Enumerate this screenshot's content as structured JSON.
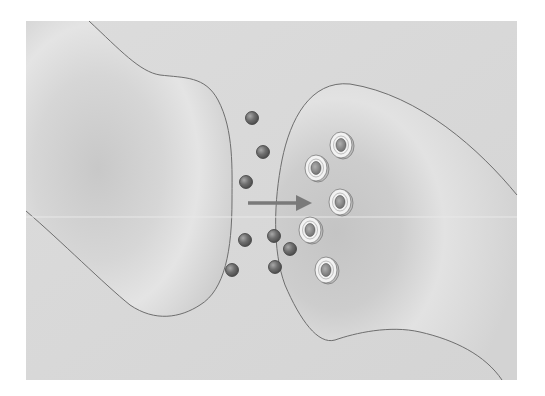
{
  "diagram": {
    "type": "synapse",
    "panel": {
      "x": 26,
      "y": 21,
      "width": 491,
      "height": 359,
      "fill": "#d9d9d9"
    },
    "colors": {
      "background": "#ffffff",
      "panel": "#d9d9d9",
      "neuron_fill": "#cfcfcf",
      "outline": "#6e6e6e",
      "arrow": "#7a7a7a",
      "neurotransmitter": "#6a6a6a",
      "receptor_ring": "#f2f2f2",
      "receptor_core": "#8a8a8a"
    },
    "neurons": [
      {
        "role": "presynaptic",
        "label": ""
      },
      {
        "role": "postsynaptic",
        "label": ""
      }
    ],
    "arrow": {
      "x1": 248,
      "y1": 203,
      "x2": 312,
      "y2": 203,
      "direction": "right"
    },
    "neurotransmitters": [
      {
        "cx": 252,
        "cy": 118
      },
      {
        "cx": 263,
        "cy": 152
      },
      {
        "cx": 246,
        "cy": 182
      },
      {
        "cx": 245,
        "cy": 240
      },
      {
        "cx": 274,
        "cy": 236
      },
      {
        "cx": 290,
        "cy": 249
      },
      {
        "cx": 275,
        "cy": 267
      },
      {
        "cx": 232,
        "cy": 270
      }
    ],
    "receptors": [
      {
        "cx": 341,
        "cy": 145
      },
      {
        "cx": 316,
        "cy": 168
      },
      {
        "cx": 340,
        "cy": 202
      },
      {
        "cx": 310,
        "cy": 230
      },
      {
        "cx": 326,
        "cy": 270
      }
    ]
  }
}
